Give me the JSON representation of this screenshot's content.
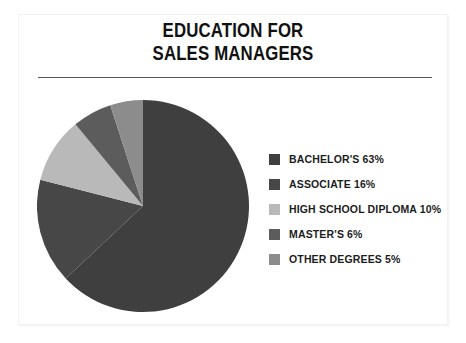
{
  "card": {
    "title_line1": "EDUCATION FOR",
    "title_line2": "SALES MANAGERS"
  },
  "legend": {
    "items": [
      {
        "label": "BACHELOR'S 63%",
        "color": "#3f3f3f"
      },
      {
        "label": "ASSOCIATE 16%",
        "color": "#474747"
      },
      {
        "label": "HIGH SCHOOL DIPLOMA 10%",
        "color": "#b9b9b9"
      },
      {
        "label": "MASTER'S 6%",
        "color": "#5c5c5c"
      },
      {
        "label": "OTHER DEGREES 5%",
        "color": "#8c8c8c"
      }
    ]
  },
  "chart_data": {
    "type": "pie",
    "title": "EDUCATION FOR SALES MANAGERS",
    "xlabel": "",
    "ylabel": "",
    "legend_position": "right",
    "grid": false,
    "start_angle_deg": 0,
    "direction": "clockwise",
    "categories": [
      "BACHELOR'S",
      "ASSOCIATE",
      "HIGH SCHOOL DIPLOMA",
      "MASTER'S",
      "OTHER DEGREES"
    ],
    "values": [
      63,
      16,
      10,
      6,
      5
    ],
    "value_labels": [
      "63%",
      "16%",
      "10%",
      "6%",
      "5%"
    ],
    "colors": [
      "#3f3f3f",
      "#474747",
      "#b9b9b9",
      "#5c5c5c",
      "#8c8c8c"
    ],
    "units": "percent",
    "total": 100
  }
}
